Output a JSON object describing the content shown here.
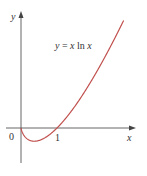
{
  "chart_data": {
    "type": "line",
    "title": "",
    "equation": "y = x ln x",
    "xlabel": "x",
    "ylabel": "y",
    "origin_label": "0",
    "x_ticks": [
      "1"
    ],
    "series": [
      {
        "name": "y = x ln x",
        "color": "#c0504d",
        "function": "x*ln(x)"
      }
    ],
    "xlim": [
      0,
      2.2
    ],
    "ylim": [
      -0.6,
      3.1
    ],
    "grid": false
  },
  "labels": {
    "y_axis": "y",
    "x_axis": "x",
    "origin": "0",
    "tick_one": "1",
    "eq_y": "y",
    "eq_eq": " = ",
    "eq_x": "x",
    "eq_ln": " ln ",
    "eq_x2": "x"
  }
}
